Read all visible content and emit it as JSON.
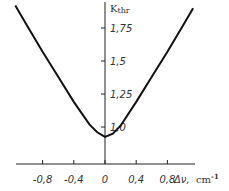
{
  "chart_data": {
    "type": "line",
    "title": "",
    "xlabel": "Δν, cm⁻¹",
    "ylabel": "K thr",
    "x_ticks": [
      "-0.8",
      "-0.4",
      "0",
      "0.4",
      "0.8"
    ],
    "y_ticks": [
      "1.0",
      "1.25",
      "1.5",
      "1.75"
    ],
    "xlim": [
      -1.15,
      1.2
    ],
    "ylim": [
      0.75,
      1.95
    ],
    "grid": false,
    "legend": null,
    "series": [
      {
        "name": "K_thr",
        "x": [
          -1.15,
          -1.0,
          -0.8,
          -0.6,
          -0.4,
          -0.2,
          -0.1,
          0.0,
          0.1,
          0.2,
          0.4,
          0.6,
          0.8,
          1.0,
          1.13
        ],
        "y": [
          1.92,
          1.77,
          1.57,
          1.38,
          1.19,
          1.02,
          0.96,
          0.925,
          0.95,
          1.01,
          1.19,
          1.38,
          1.57,
          1.77,
          1.9
        ]
      }
    ]
  },
  "labels": {
    "y_axis": "K",
    "y_axis_sub": "thr",
    "x_axis": "Δν,",
    "x_unit": "cm",
    "x_unit_exp": "-1",
    "x_ticks": [
      "-0,8",
      "-0,4",
      "0",
      "0,4",
      "0,8"
    ],
    "y_ticks": [
      "1,0",
      "1,25",
      "1,5",
      "1,75"
    ]
  }
}
